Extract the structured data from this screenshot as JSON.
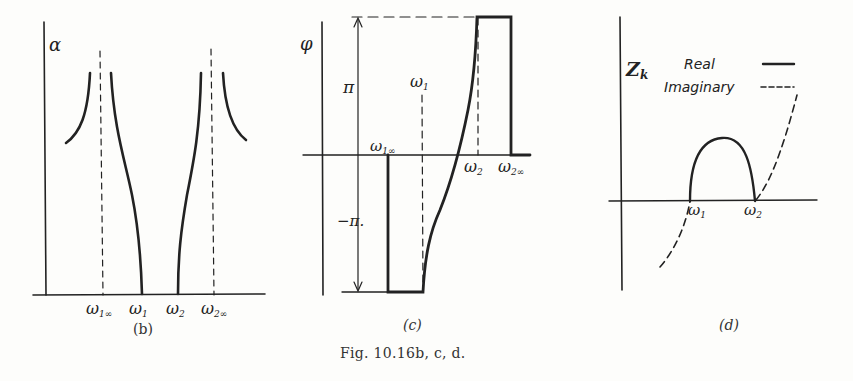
{
  "figure_caption": "Fig. 10.16b, c, d.",
  "colors": {
    "ink": "#222222",
    "paper": "#fdfdfb"
  },
  "panels": [
    {
      "id": "b",
      "caption": "(b)",
      "y_label": "α",
      "x_ticks": [
        {
          "sym": "ω",
          "sub": "1∞"
        },
        {
          "sym": "ω",
          "sub": "1"
        },
        {
          "sym": "ω",
          "sub": "2"
        },
        {
          "sym": "ω",
          "sub": "2∞"
        }
      ]
    },
    {
      "id": "c",
      "caption": "(c)",
      "y_label": "φ",
      "y_marks": [
        "π",
        "−π."
      ],
      "x_ticks": [
        {
          "sym": "ω",
          "sub": "1∞"
        },
        {
          "sym": "ω",
          "sub": "1"
        },
        {
          "sym": "ω",
          "sub": "2"
        },
        {
          "sym": "ω",
          "sub": "2∞"
        }
      ]
    },
    {
      "id": "d",
      "caption": "(d)",
      "y_label": "Z",
      "y_label_sub": "k",
      "legend": [
        {
          "label": "Real",
          "style": "solid"
        },
        {
          "label": "Imaginary",
          "style": "dashed"
        }
      ],
      "x_ticks": [
        {
          "sym": "ω",
          "sub": "1"
        },
        {
          "sym": "ω",
          "sub": "2"
        }
      ]
    }
  ]
}
